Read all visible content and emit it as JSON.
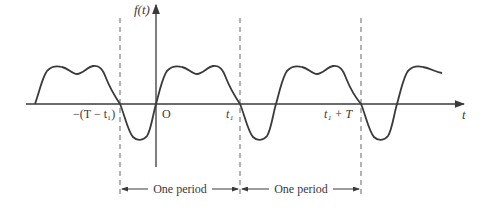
{
  "diagram": {
    "type": "periodic-waveform",
    "y_axis_label": "f(t)",
    "x_axis_label": "t",
    "origin_label": "O",
    "tick_labels": [
      {
        "text": "−(T − t₁)",
        "x": 120
      },
      {
        "text": "O",
        "x": 156
      },
      {
        "text": "t₁",
        "x": 240
      },
      {
        "text": "t₁ + T",
        "x": 361
      }
    ],
    "dashed_markers_x": [
      120,
      240,
      361
    ],
    "period_annotations": [
      {
        "label": "One period",
        "from": "−(T − t₁)",
        "to": "t₁"
      },
      {
        "label": "One period",
        "from": "t₁",
        "to": "t₁ + T"
      }
    ],
    "colors": {
      "line": "#3a3a3a",
      "dash": "#555555",
      "background": "#ffffff"
    }
  }
}
